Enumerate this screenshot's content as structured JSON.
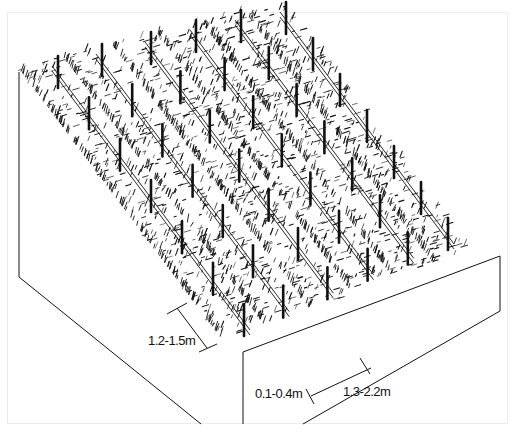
{
  "diagram": {
    "colors": {
      "ink": "#111111",
      "background": "#ffffff",
      "frame": "#ececec"
    },
    "labels": {
      "row_strip_width": "1.2-1.5m",
      "furrow_width": "0.1-0.4m",
      "row_spacing": "1.3-2.2m"
    },
    "rows": 6,
    "posts_per_row": 7
  }
}
